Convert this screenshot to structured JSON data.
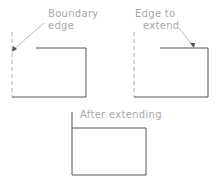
{
  "diagram": {
    "type": "cad-extend-operation",
    "panels": [
      {
        "id": "before-boundary",
        "labels": [
          "Boundary",
          "edge"
        ],
        "annotation_target": "dashed boundary edge"
      },
      {
        "id": "before-edge",
        "labels": [
          "Edge to",
          "extend"
        ],
        "annotation_target": "top edge of shape"
      },
      {
        "id": "after",
        "labels": [
          "After extending"
        ]
      }
    ],
    "colors": {
      "geometry": "#555555",
      "boundary_dashed": "#b0b0b0",
      "label_text": "#a8a8a8",
      "background": "#ffffff"
    }
  }
}
